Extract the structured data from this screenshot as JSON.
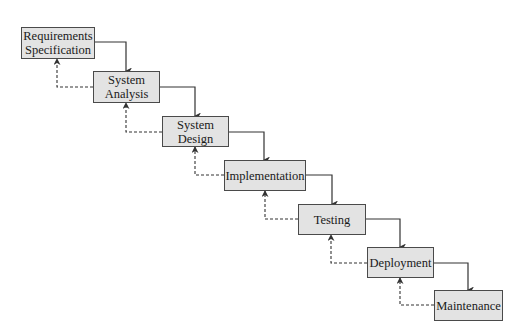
{
  "diagram": {
    "type": "waterfall-model",
    "colors": {
      "box_fill": "#e3e3e3",
      "box_border": "#4a4a4a",
      "arrow": "#333333",
      "text": "#1a1a1a",
      "background": "#ffffff"
    },
    "stages": [
      {
        "id": "requirements",
        "label": "Requirements\nSpecification",
        "x": 21,
        "y": 27,
        "w": 74,
        "h": 32
      },
      {
        "id": "analysis",
        "label": "System\nAnalysis",
        "x": 93,
        "y": 71,
        "w": 67,
        "h": 32
      },
      {
        "id": "design",
        "label": "System\nDesign",
        "x": 162,
        "y": 116,
        "w": 67,
        "h": 31
      },
      {
        "id": "implementation",
        "label": "Implementation",
        "x": 224,
        "y": 160,
        "w": 82,
        "h": 31
      },
      {
        "id": "testing",
        "label": "Testing",
        "x": 298,
        "y": 204,
        "w": 68,
        "h": 31
      },
      {
        "id": "deployment",
        "label": "Deployment",
        "x": 367,
        "y": 247,
        "w": 67,
        "h": 31
      },
      {
        "id": "maintenance",
        "label": "Maintenance",
        "x": 434,
        "y": 290,
        "w": 69,
        "h": 31
      }
    ],
    "forward_arrows": [
      {
        "from": "requirements",
        "to": "analysis",
        "points": "95,42 126,42 126,71"
      },
      {
        "from": "analysis",
        "to": "design",
        "points": "160,87 195,87 195,116"
      },
      {
        "from": "design",
        "to": "implementation",
        "points": "229,132 264,132 264,160"
      },
      {
        "from": "implementation",
        "to": "testing",
        "points": "306,175 332,175 332,204"
      },
      {
        "from": "testing",
        "to": "deployment",
        "points": "366,219 400,219 400,247"
      },
      {
        "from": "deployment",
        "to": "maintenance",
        "points": "434,263 468,263 468,290"
      }
    ],
    "feedback_arrows": [
      {
        "from": "analysis",
        "to": "requirements",
        "points": "93,87 57,87 57,59"
      },
      {
        "from": "design",
        "to": "analysis",
        "points": "162,132 126,132 126,103"
      },
      {
        "from": "implementation",
        "to": "design",
        "points": "224,175 195,175 195,147"
      },
      {
        "from": "testing",
        "to": "implementation",
        "points": "298,219 265,219 265,191"
      },
      {
        "from": "deployment",
        "to": "testing",
        "points": "367,263 331,263 331,235"
      },
      {
        "from": "maintenance",
        "to": "deployment",
        "points": "434,305 400,305 400,278"
      }
    ]
  }
}
